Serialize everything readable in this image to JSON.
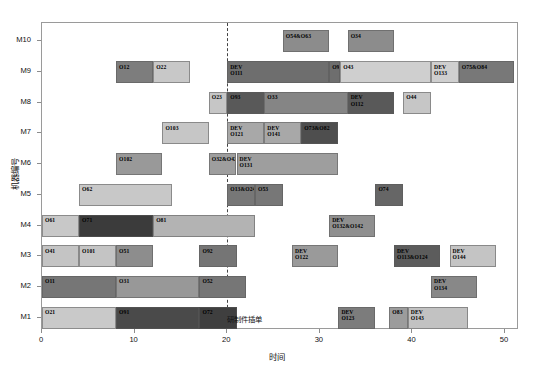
{
  "chart_data": {
    "type": "bar",
    "chart_style": "gantt",
    "title": "",
    "xlabel": "时间",
    "ylabel": "机器编号",
    "xlim": [
      0,
      51.5
    ],
    "xticks": [
      0,
      10,
      20,
      30,
      40,
      50
    ],
    "grid": false,
    "legend": "none",
    "categories": [
      "M1",
      "M2",
      "M3",
      "M4",
      "M5",
      "M6",
      "M7",
      "M8",
      "M9",
      "M10"
    ],
    "annotations": [
      {
        "name": "insert-event",
        "label": "研制件插单",
        "x": 20
      }
    ],
    "rows": [
      {
        "machine": "M10",
        "tasks": [
          {
            "label": "O54&O63",
            "start": 26,
            "end": 31,
            "color": "#8c8c8c"
          },
          {
            "label": "O34",
            "start": 33,
            "end": 38,
            "color": "#8c8c8c"
          }
        ]
      },
      {
        "machine": "M9",
        "tasks": [
          {
            "label": "O12",
            "start": 8,
            "end": 12,
            "color": "#7d7d7d"
          },
          {
            "label": "O22",
            "start": 12,
            "end": 16,
            "color": "#c8c8c8"
          },
          {
            "label": "DEV\nO111",
            "start": 20,
            "end": 31,
            "color": "#6e6e6e"
          },
          {
            "label": "O94&O104",
            "start": 31,
            "end": 32.2,
            "color": "#6e6e6e"
          },
          {
            "label": "O43",
            "start": 32.2,
            "end": 42,
            "color": "#cfcfcf"
          },
          {
            "label": "DEV\nO133",
            "start": 42,
            "end": 45,
            "color": "#cfcfcf"
          },
          {
            "label": "O75&O84",
            "start": 45,
            "end": 51,
            "color": "#787878"
          }
        ]
      },
      {
        "machine": "M8",
        "tasks": [
          {
            "label": "O23",
            "start": 18,
            "end": 20,
            "color": "#c6c6c6"
          },
          {
            "label": "O93",
            "start": 20,
            "end": 24,
            "color": "#595959"
          },
          {
            "label": "O33",
            "start": 24,
            "end": 33,
            "color": "#858585"
          },
          {
            "label": "DEV\nO112",
            "start": 33,
            "end": 38,
            "color": "#595959"
          },
          {
            "label": "O44",
            "start": 39,
            "end": 42,
            "color": "#c6c6c6"
          }
        ]
      },
      {
        "machine": "M7",
        "tasks": [
          {
            "label": "O103",
            "start": 13,
            "end": 18,
            "color": "#c6c6c6"
          },
          {
            "label": "DEV\nO121",
            "start": 20,
            "end": 24,
            "color": "#a8a8a8"
          },
          {
            "label": "DEV\nO141",
            "start": 24,
            "end": 28,
            "color": "#a8a8a8"
          },
          {
            "label": "O73&O82",
            "start": 28,
            "end": 32,
            "color": "#4e4e4e"
          }
        ]
      },
      {
        "machine": "M6",
        "tasks": [
          {
            "label": "O102",
            "start": 8,
            "end": 13,
            "color": "#999999"
          },
          {
            "label": "O32&O42",
            "start": 18,
            "end": 21,
            "color": "#9e9e9e"
          },
          {
            "label": "DEV\nO131",
            "start": 21,
            "end": 32,
            "color": "#9e9e9e"
          }
        ]
      },
      {
        "machine": "M5",
        "tasks": [
          {
            "label": "O62",
            "start": 4,
            "end": 14,
            "color": "#c8c8c8"
          },
          {
            "label": "O13&O24",
            "start": 20,
            "end": 23,
            "color": "#777777"
          },
          {
            "label": "O53",
            "start": 23,
            "end": 26,
            "color": "#777777"
          },
          {
            "label": "O74",
            "start": 36,
            "end": 39,
            "color": "#666666"
          }
        ]
      },
      {
        "machine": "M4",
        "tasks": [
          {
            "label": "O61",
            "start": 0,
            "end": 4,
            "color": "#c8c8c8"
          },
          {
            "label": "O71",
            "start": 4,
            "end": 12,
            "color": "#3b3b3b"
          },
          {
            "label": "O81",
            "start": 12,
            "end": 23,
            "color": "#b3b3b3"
          },
          {
            "label": "DEV\nO132&O142",
            "start": 31,
            "end": 36,
            "color": "#8f8f8f"
          }
        ]
      },
      {
        "machine": "M3",
        "tasks": [
          {
            "label": "O41",
            "start": 0,
            "end": 4,
            "color": "#c4c4c4"
          },
          {
            "label": "O101",
            "start": 4,
            "end": 8,
            "color": "#c4c4c4"
          },
          {
            "label": "O51",
            "start": 8,
            "end": 12,
            "color": "#8d8d8d"
          },
          {
            "label": "O92",
            "start": 17,
            "end": 21,
            "color": "#757575"
          },
          {
            "label": "DEV\nO122",
            "start": 27,
            "end": 32,
            "color": "#9a9a9a"
          },
          {
            "label": "DEV\nO113&O124",
            "start": 38,
            "end": 43,
            "color": "#5c5c5c"
          },
          {
            "label": "DEV\nO144",
            "start": 44,
            "end": 49,
            "color": "#c4c4c4"
          }
        ]
      },
      {
        "machine": "M2",
        "tasks": [
          {
            "label": "O11",
            "start": 0,
            "end": 8,
            "color": "#767676"
          },
          {
            "label": "O31",
            "start": 8,
            "end": 17,
            "color": "#989898"
          },
          {
            "label": "O52",
            "start": 17,
            "end": 22,
            "color": "#767676"
          },
          {
            "label": "DEV\nO134",
            "start": 42,
            "end": 47,
            "color": "#888888"
          }
        ]
      },
      {
        "machine": "M1",
        "tasks": [
          {
            "label": "O21",
            "start": 0,
            "end": 8,
            "color": "#c9c9c9"
          },
          {
            "label": "O91",
            "start": 8,
            "end": 17,
            "color": "#4a4a4a"
          },
          {
            "label": "O72",
            "start": 17,
            "end": 21,
            "color": "#3f3f3f"
          },
          {
            "label": "DEV\nO123",
            "start": 32,
            "end": 36,
            "color": "#7c7c7c"
          },
          {
            "label": "O83",
            "start": 37.5,
            "end": 39.5,
            "color": "#9c9c9c"
          },
          {
            "label": "DEV\nO143",
            "start": 39.5,
            "end": 46,
            "color": "#c2c2c2"
          }
        ]
      }
    ]
  },
  "axis": {
    "x_title": "时间",
    "y_title": "机器编号",
    "x_tick_labels": [
      "0",
      "10",
      "20",
      "30",
      "40",
      "50"
    ],
    "y_tick_labels": [
      "M10",
      "M9",
      "M8",
      "M7",
      "M6",
      "M5",
      "M4",
      "M3",
      "M2",
      "M1"
    ]
  },
  "header": {
    "left_mark": "",
    "right_mark": ""
  }
}
